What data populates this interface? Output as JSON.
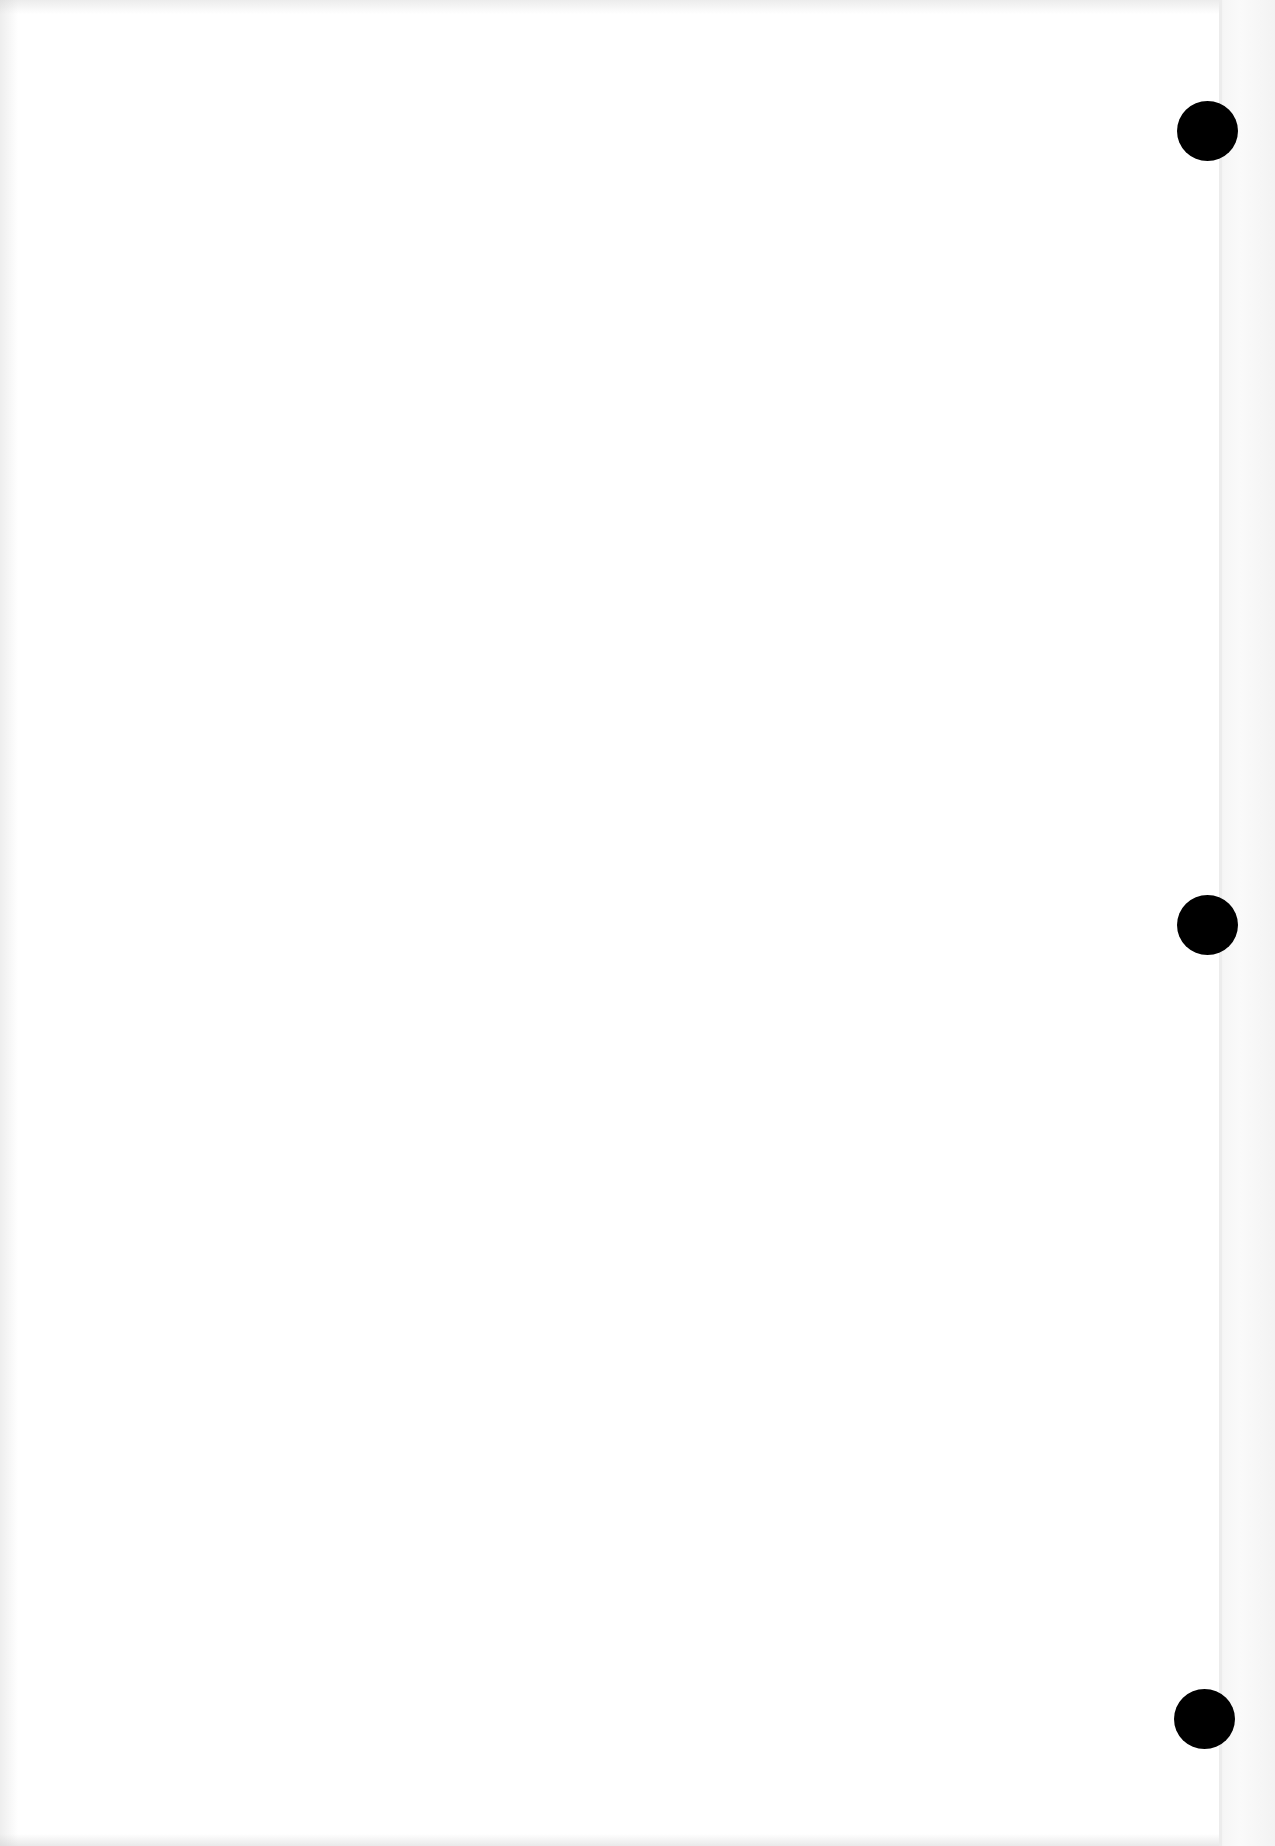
{
  "page": {
    "type": "blank scanned sheet",
    "background_color": "#ffffff",
    "text_content": "",
    "punch_holes": [
      {
        "position": "top-right",
        "color": "#000000"
      },
      {
        "position": "middle-right",
        "color": "#000000"
      },
      {
        "position": "bottom-right",
        "color": "#000000"
      }
    ]
  }
}
